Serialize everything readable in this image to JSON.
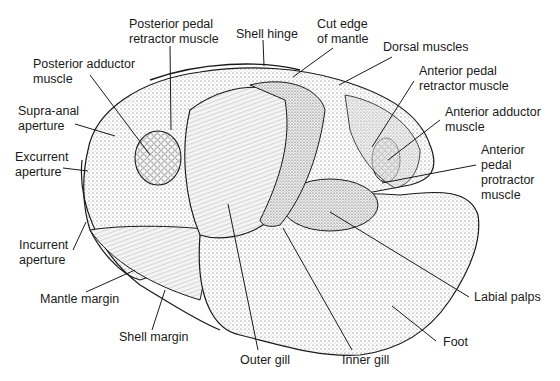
{
  "labels": {
    "posterior_pedal_retractor": "Posterior pedal\nretractor muscle",
    "shell_hinge": "Shell hinge",
    "cut_edge_of_mantle": "Cut edge\nof mantle",
    "dorsal_muscles": "Dorsal muscles",
    "posterior_adductor": "Posterior adductor\nmuscle",
    "anterior_pedal_retractor": "Anterior pedal\nretractor muscle",
    "supra_anal_aperture": "Supra-anal\naperture",
    "anterior_adductor": "Anterior adductor\nmuscle",
    "excurrent_aperture": "Excurrent\naperture",
    "anterior_pedal_protractor": "Anterior\npedal\nprotractor\nmuscle",
    "incurrent_aperture": "Incurrent\naperture",
    "mantle_margin": "Mantle margin",
    "labial_palps": "Labial palps",
    "shell_margin": "Shell margin",
    "foot": "Foot",
    "outer_gill": "Outer gill",
    "inner_gill": "Inner gill"
  },
  "colors": {
    "ink": "#1a1a1a",
    "background": "#ffffff",
    "shade": "#d9d9d9"
  }
}
